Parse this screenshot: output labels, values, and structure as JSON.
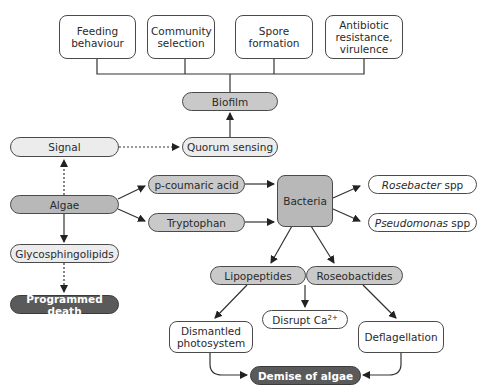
{
  "diagram": {
    "type": "flowchart",
    "colors": {
      "line": "#333333",
      "dark_node": "#5a5a5a",
      "mid_node": "#c9c9c9",
      "light_node": "#ececec",
      "white_node": "#ffffff"
    },
    "outcomes_top": [
      {
        "label": "Feeding behaviour"
      },
      {
        "label": "Community selection"
      },
      {
        "label": "Spore formation"
      },
      {
        "label": "Antibiotic resistance, virulence"
      }
    ],
    "biofilm": {
      "label": "Biofilm"
    },
    "signal": {
      "label": "Signal"
    },
    "quorum_sensing": {
      "label": "Quorum sensing"
    },
    "algae": {
      "label": "Algae"
    },
    "p_coumaric_acid": {
      "label": "p-coumaric acid"
    },
    "tryptophan": {
      "label": "Tryptophan"
    },
    "bacteria": {
      "label": "Bacteria"
    },
    "rosebacter": {
      "genus": "Rosebacter",
      "suffix": " spp"
    },
    "pseudomonas": {
      "genus": "Pseudomonas",
      "suffix": " spp"
    },
    "glycosphingolipids": {
      "label": "Glycosphingolipids"
    },
    "programmed_death": {
      "label": "Programmed death"
    },
    "lipopeptides": {
      "label": "Lipopeptides"
    },
    "roseobactides": {
      "label": "Roseobactides"
    },
    "disrupt_ca": {
      "label": "Disrupt Ca",
      "superscript": "2+"
    },
    "dismantled_photosystem": {
      "label": "Dismantled photosystem"
    },
    "deflagellation": {
      "label": "Deflagellation"
    },
    "demise_of_algae": {
      "label": "Demise of algae"
    },
    "edges": [
      {
        "from": "Biofilm",
        "to": "Feeding behaviour / Community selection / Spore formation / Antibiotic resistance, virulence",
        "style": "bracket"
      },
      {
        "from": "Quorum sensing",
        "to": "Biofilm",
        "style": "solid"
      },
      {
        "from": "Signal",
        "to": "Quorum sensing",
        "style": "dashed"
      },
      {
        "from": "Algae",
        "to": "Signal",
        "style": "dashed"
      },
      {
        "from": "Algae",
        "to": "p-coumaric acid",
        "style": "solid"
      },
      {
        "from": "Algae",
        "to": "Tryptophan",
        "style": "solid"
      },
      {
        "from": "Algae",
        "to": "Glycosphingolipids",
        "style": "solid"
      },
      {
        "from": "Glycosphingolipids",
        "to": "Programmed death",
        "style": "dashed"
      },
      {
        "from": "p-coumaric acid",
        "to": "Bacteria",
        "style": "solid"
      },
      {
        "from": "Tryptophan",
        "to": "Bacteria",
        "style": "solid"
      },
      {
        "from": "Bacteria",
        "to": "Rosebacter spp",
        "style": "solid"
      },
      {
        "from": "Bacteria",
        "to": "Pseudomonas spp",
        "style": "solid"
      },
      {
        "from": "Bacteria",
        "to": "Lipopeptides",
        "style": "solid"
      },
      {
        "from": "Bacteria",
        "to": "Roseobactides",
        "style": "solid"
      },
      {
        "from": "Lipopeptides",
        "to": "Dismantled photosystem",
        "style": "solid"
      },
      {
        "from": "Lipopeptides/Roseobactides",
        "to": "Disrupt Ca2+",
        "style": "solid"
      },
      {
        "from": "Roseobactides",
        "to": "Deflagellation",
        "style": "solid"
      },
      {
        "from": "Dismantled photosystem",
        "to": "Demise of algae",
        "style": "solid"
      },
      {
        "from": "Deflagellation",
        "to": "Demise of algae",
        "style": "solid"
      }
    ]
  }
}
